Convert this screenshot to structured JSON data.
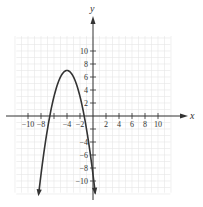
{
  "chart_data": {
    "type": "line",
    "title": "",
    "xlabel": "x",
    "ylabel": "y",
    "xlim": [
      -12,
      12
    ],
    "ylim": [
      -12,
      12
    ],
    "grid": true,
    "x_ticks": [
      -10,
      -8,
      -6,
      -4,
      -2,
      2,
      4,
      6,
      8,
      10
    ],
    "x_tick_labels": [
      "−10",
      "−8",
      "",
      "−4",
      "−2",
      "2",
      "4",
      "6",
      "8",
      "10"
    ],
    "y_ticks": [
      -10,
      -8,
      -6,
      -4,
      -2,
      2,
      4,
      6,
      8,
      10
    ],
    "y_tick_labels": [
      "−10",
      "−8",
      "−6",
      "−4",
      "",
      "2",
      "4",
      "6",
      "8",
      "10"
    ],
    "series": [
      {
        "name": "parabola",
        "equation": "y = -(x + 4)^2 + 7",
        "vertex": [
          -4,
          7
        ],
        "x_intercepts": [
          -6.65,
          -1.35
        ],
        "y_intercept": -9,
        "x": [
          -8.5,
          -8,
          -7,
          -6,
          -5,
          -4,
          -3,
          -2,
          -1,
          0,
          0.3
        ],
        "values": [
          -13.25,
          -9,
          -2,
          3,
          6,
          7,
          6,
          3,
          -2,
          -9,
          -11.49
        ],
        "arrows": "both ends",
        "color": "#333333"
      }
    ]
  }
}
